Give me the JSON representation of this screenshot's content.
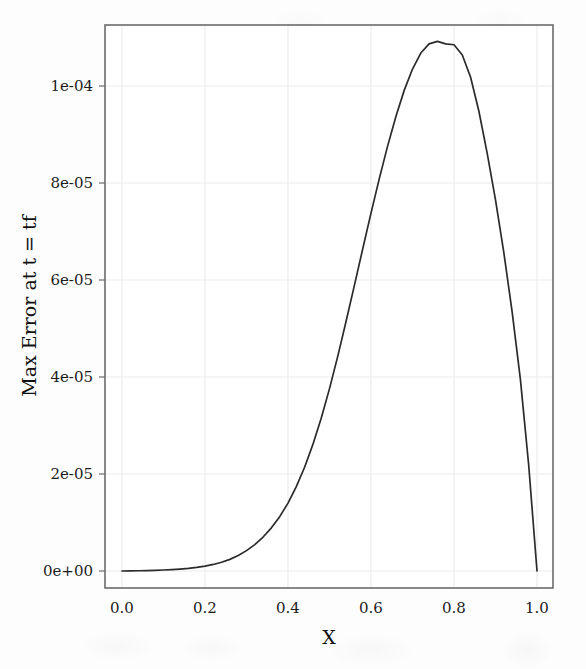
{
  "figure": {
    "background_color": "#fdfdfd",
    "plot_frame_color": "#6b6b6b",
    "grid_color": "#ececec",
    "line_color": "#2b2b2b"
  },
  "chart_data": {
    "type": "line",
    "title": "",
    "xlabel": "X",
    "ylabel": "Max Error at t = tf",
    "xlim": [
      -0.04,
      1.04
    ],
    "ylim": [
      -7.5e-06,
      0.0001175
    ],
    "grid": true,
    "legend": null,
    "xticks": [
      0.0,
      0.2,
      0.4,
      0.6,
      0.8,
      1.0
    ],
    "xtick_labels": [
      "0.0",
      "0.2",
      "0.4",
      "0.6",
      "0.8",
      "1.0"
    ],
    "yticks": [
      0.0,
      2e-05,
      4e-05,
      6e-05,
      8e-05,
      0.0001
    ],
    "ytick_labels": [
      "0e+00",
      "2e-05",
      "4e-05",
      "6e-05",
      "8e-05",
      "1e-04"
    ],
    "series": [
      {
        "name": "max error",
        "x": [
          0.0,
          0.02,
          0.04,
          0.06,
          0.08,
          0.1,
          0.12,
          0.14,
          0.16,
          0.18,
          0.2,
          0.22,
          0.24,
          0.26,
          0.28,
          0.3,
          0.32,
          0.34,
          0.36,
          0.38,
          0.4,
          0.42,
          0.44,
          0.46,
          0.48,
          0.5,
          0.52,
          0.54,
          0.56,
          0.58,
          0.6,
          0.62,
          0.64,
          0.66,
          0.68,
          0.7,
          0.72,
          0.74,
          0.76,
          0.78,
          0.8,
          0.82,
          0.84,
          0.86,
          0.88,
          0.9,
          0.92,
          0.94,
          0.96,
          0.98,
          1.0
        ],
        "y": [
          0.0,
          2e-08,
          5e-08,
          9e-08,
          1.4e-07,
          2.1e-07,
          2.9e-07,
          4e-07,
          5.4e-07,
          7.4e-07,
          1e-06,
          1.35e-06,
          1.8e-06,
          2.4e-06,
          3.2e-06,
          4.2e-06,
          5.45e-06,
          7e-06,
          8.9e-06,
          1.12e-05,
          1.4e-05,
          1.74e-05,
          2.14e-05,
          2.61e-05,
          3.15e-05,
          3.76e-05,
          4.43e-05,
          5.15e-05,
          5.89e-05,
          6.64e-05,
          7.38e-05,
          8.09e-05,
          8.76e-05,
          9.37e-05,
          9.91e-05,
          0.0001035,
          0.0001068,
          0.0001087,
          0.0001092,
          0.0001087,
          0.0001085,
          0.0001064,
          0.0001018,
          9.48e-05,
          8.61e-05,
          7.65e-05,
          6.57e-05,
          5.35e-05,
          3.95e-05,
          2.18e-05,
          0.0
        ]
      }
    ],
    "annotations": {
      "peak_x": 0.8,
      "peak_y": 0.0001085
    }
  }
}
